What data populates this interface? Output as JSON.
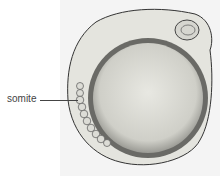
{
  "figure": {
    "labels": [
      {
        "text": "somite"
      }
    ]
  },
  "colors": {
    "background": "#ffffff",
    "plate": "#f4f4f4",
    "yolk": "#d8d8d2",
    "outline": "#333333"
  }
}
